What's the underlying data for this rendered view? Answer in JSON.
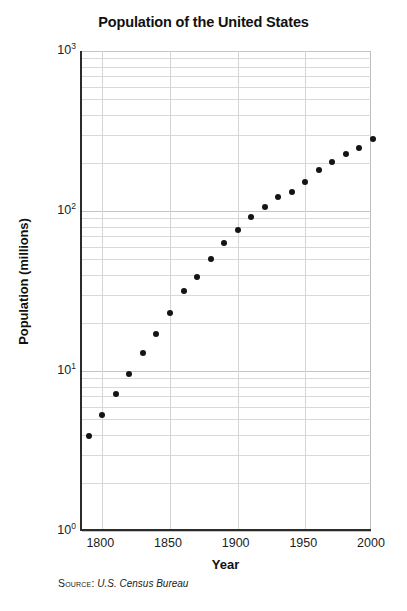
{
  "chart_data": {
    "type": "scatter",
    "title": "Population of the United States",
    "xlabel": "Year",
    "ylabel": "Population (millions)",
    "source_prefix": "Source:",
    "source_value": "U.S. Census Bureau",
    "yscale": "log",
    "xscale": "linear",
    "xlim": [
      1785,
      2000
    ],
    "ylim": [
      1,
      1000
    ],
    "grid": true,
    "legend": "none",
    "x_tick_labels": [
      "1800",
      "1850",
      "1900",
      "1950",
      "2000"
    ],
    "x_ticks": [
      1800,
      1850,
      1900,
      1950,
      2000
    ],
    "y_tick_labels": [
      "10^0",
      "10^1",
      "10^2",
      "10^3"
    ],
    "y_ticks": [
      1,
      10,
      100,
      1000
    ],
    "y_tick_mantissa": [
      "10",
      "10",
      "10",
      "10"
    ],
    "y_tick_exponent": [
      "0",
      "1",
      "2",
      "3"
    ],
    "y_minor_ticks": [
      2,
      3,
      4,
      5,
      6,
      7,
      8,
      9
    ],
    "point_marker": "filled-circle",
    "point_color": "#141414",
    "grid_color": "#d9d9d9",
    "axis_color": "#2b2b2b",
    "x": [
      1790,
      1800,
      1810,
      1820,
      1830,
      1840,
      1850,
      1860,
      1870,
      1880,
      1890,
      1900,
      1910,
      1920,
      1930,
      1940,
      1950,
      1960,
      1970,
      1980,
      1990,
      2000
    ],
    "y": [
      3.9,
      5.3,
      7.2,
      9.6,
      12.9,
      17.1,
      23.2,
      31.4,
      38.6,
      50.2,
      63.0,
      76.2,
      92.2,
      106.0,
      123.2,
      132.2,
      151.3,
      179.3,
      203.3,
      226.5,
      248.7,
      281.4
    ],
    "series": [
      {
        "name": "U.S. population (millions)",
        "values": [
          3.9,
          5.3,
          7.2,
          9.6,
          12.9,
          17.1,
          23.2,
          31.4,
          38.6,
          50.2,
          63.0,
          76.2,
          92.2,
          106.0,
          123.2,
          132.2,
          151.3,
          179.3,
          203.3,
          226.5,
          248.7,
          281.4
        ]
      }
    ]
  }
}
